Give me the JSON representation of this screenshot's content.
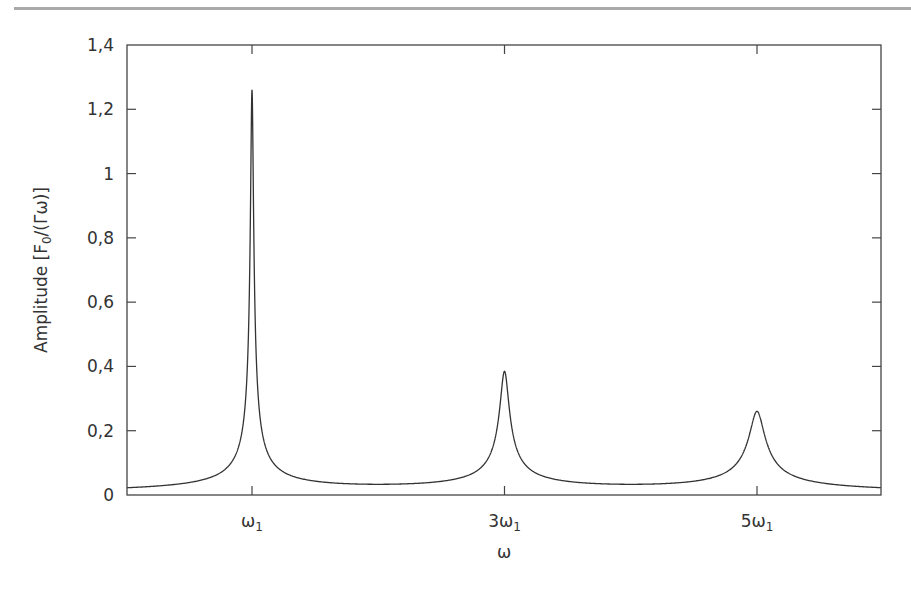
{
  "chart_data": {
    "type": "line",
    "title": "",
    "xlabel": "ω",
    "ylabel": "Amplitude [F₀/(Γω)]",
    "ylabel_parts": {
      "main": "Amplitude [F",
      "sub": "0",
      "tail": "/(Γω)]"
    },
    "ylim": [
      0,
      1.4
    ],
    "grid": false,
    "legend": null,
    "y_ticks": [
      {
        "value": 0,
        "label": "0"
      },
      {
        "value": 0.2,
        "label": "0,2"
      },
      {
        "value": 0.4,
        "label": "0,4"
      },
      {
        "value": 0.6,
        "label": "0,6"
      },
      {
        "value": 0.8,
        "label": "0,8"
      },
      {
        "value": 1.0,
        "label": "1"
      },
      {
        "value": 1.2,
        "label": "1,2"
      },
      {
        "value": 1.4,
        "label": "1,4"
      }
    ],
    "x_ticks": [
      {
        "position": 1,
        "label_main": "ω",
        "label_sub": "1",
        "label_prefix": ""
      },
      {
        "position": 3,
        "label_main": "ω",
        "label_sub": "1",
        "label_prefix": "3"
      },
      {
        "position": 5,
        "label_main": "ω",
        "label_sub": "1",
        "label_prefix": "5"
      }
    ],
    "xlim": [
      0,
      5.95
    ],
    "series": [
      {
        "name": "amplitude",
        "color": "#333333",
        "peaks": [
          {
            "x": 1,
            "label": "ω1",
            "height": 1.25
          },
          {
            "x": 3,
            "label": "3ω1",
            "height": 0.37
          },
          {
            "x": 5,
            "label": "5ω1",
            "height": 0.25
          }
        ]
      }
    ]
  },
  "colors": {
    "axis": "#444444",
    "curve": "#333333",
    "top_rule": "#a9a9a9",
    "text": "#333333"
  }
}
